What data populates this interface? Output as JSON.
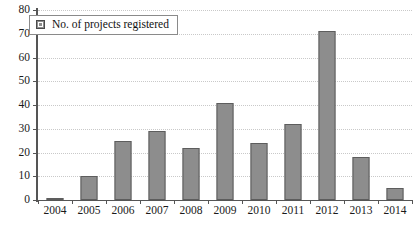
{
  "chart_data": {
    "type": "bar",
    "title": "",
    "subtitle": "",
    "xlabel": "",
    "ylabel": "",
    "categories": [
      "2004",
      "2005",
      "2006",
      "2007",
      "2008",
      "2009",
      "2010",
      "2011",
      "2012",
      "2013",
      "2014"
    ],
    "values": [
      1,
      10,
      25,
      29,
      22,
      41,
      24,
      32,
      71,
      18,
      5
    ],
    "series": [
      {
        "name": "No. of projects registered",
        "values": [
          1,
          10,
          25,
          29,
          22,
          41,
          24,
          32,
          71,
          18,
          5
        ]
      }
    ],
    "ylim": [
      0,
      80
    ],
    "ytick_step": 10,
    "yticks": [
      "80",
      "70",
      "60",
      "50",
      "40",
      "30",
      "20",
      "10",
      "0"
    ],
    "grid": "horizontal-dotted",
    "legend_position": "top-left",
    "bar_color": "#8d8d8d",
    "bar_border_color": "#5d5d5d",
    "grid_color": "#c9c9c9",
    "axis_color": "#555555",
    "text_color": "#1a1a1a"
  },
  "legend": {
    "entries": [
      {
        "label": "No. of projects registered",
        "swatch": "legend-swatch-gray"
      }
    ]
  }
}
